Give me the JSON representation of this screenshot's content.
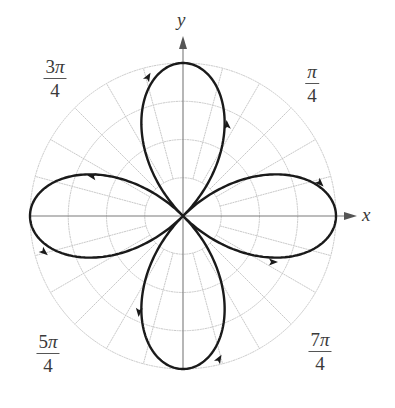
{
  "chart_data": {
    "type": "polar-line",
    "title": "",
    "equation": "r = cos(2θ)",
    "xlabel": "x",
    "ylabel": "y",
    "petals": 4,
    "petal_directions": [
      "0",
      "π/2",
      "π",
      "3π/2"
    ],
    "r_max": 1,
    "grid": {
      "circles": [
        0.25,
        0.5,
        0.75,
        1.0
      ],
      "radial_step_deg": 15,
      "radial_start_r": 0.25
    },
    "angle_labels": [
      {
        "numerator": "π",
        "coef": "",
        "denominator": "4",
        "angle": "π/4"
      },
      {
        "numerator": "π",
        "coef": "3",
        "denominator": "4",
        "angle": "3π/4"
      },
      {
        "numerator": "π",
        "coef": "5",
        "denominator": "4",
        "angle": "5π/4"
      },
      {
        "numerator": "π",
        "coef": "7",
        "denominator": "4",
        "angle": "7π/4"
      }
    ],
    "arrows_count": 8
  },
  "layout": {
    "center": [
      183,
      216
    ],
    "scale_px": 153,
    "curve_color": "#1a1a1a",
    "grid_color": "#c9c9c9",
    "axis_color": "#7a7a7a",
    "arrows": [
      {
        "x": 148,
        "y": 77,
        "dir": -60
      },
      {
        "x": 227,
        "y": 125,
        "dir": -95
      },
      {
        "x": 92,
        "y": 176,
        "dir": 190
      },
      {
        "x": 320,
        "y": 183,
        "dir": 45
      },
      {
        "x": 44,
        "y": 252,
        "dir": 40
      },
      {
        "x": 273,
        "y": 262,
        "dir": 0
      },
      {
        "x": 139,
        "y": 312,
        "dir": 95
      },
      {
        "x": 219,
        "y": 359,
        "dir": -60
      }
    ]
  },
  "labels": {
    "x_axis": "x",
    "y_axis": "y",
    "pi_over_4": {
      "coef": "",
      "sym": "π",
      "den": "4"
    },
    "three_pi_over_4": {
      "coef": "3",
      "sym": "π",
      "den": "4"
    },
    "five_pi_over_4": {
      "coef": "5",
      "sym": "π",
      "den": "4"
    },
    "seven_pi_over_4": {
      "coef": "7",
      "sym": "π",
      "den": "4"
    }
  }
}
